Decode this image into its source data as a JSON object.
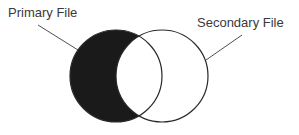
{
  "diagram": {
    "type": "venn",
    "labels": {
      "primary": "Primary File",
      "secondary": "Secondary File"
    },
    "circles": [
      {
        "name": "primary",
        "cx": 116,
        "cy": 76,
        "r": 46,
        "highlighted_region": "primary-only"
      },
      {
        "name": "secondary",
        "cx": 162,
        "cy": 76,
        "r": 46
      }
    ],
    "colors": {
      "fill": "#1a1a1a",
      "stroke": "#2a2a2a",
      "background": "#ffffff"
    }
  }
}
